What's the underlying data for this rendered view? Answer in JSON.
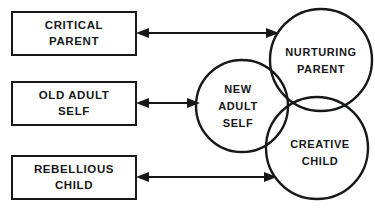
{
  "diagram": {
    "type": "relationship-venn-diagram",
    "background_color": "#ffffff",
    "stroke_color": "#16181a",
    "boxes": [
      {
        "id": "critical-parent",
        "line1": "CRITICAL",
        "line2": "PARENT",
        "full_label": "CRITICAL PARENT"
      },
      {
        "id": "old-adult-self",
        "line1": "OLD ADULT",
        "line2": "SELF",
        "full_label": "OLD ADULT SELF"
      },
      {
        "id": "rebellious-child",
        "line1": "REBELLIOUS",
        "line2": "CHILD",
        "full_label": "REBELLIOUS CHILD"
      }
    ],
    "circles": [
      {
        "id": "nurturing-parent",
        "line1": "NURTURING",
        "line2": "PARENT",
        "full_label": "NURTURING PARENT"
      },
      {
        "id": "new-adult-self",
        "line1": "NEW",
        "line2": "ADULT",
        "line3": "SELF",
        "full_label": "NEW ADULT SELF"
      },
      {
        "id": "creative-child",
        "line1": "CREATIVE",
        "line2": "CHILD",
        "full_label": "CREATIVE CHILD"
      }
    ],
    "connectors": [
      {
        "id": "critical-parent-to-nurturing-parent",
        "from": "CRITICAL PARENT",
        "to": "NURTURING PARENT",
        "style": "double-headed-arrow"
      },
      {
        "id": "old-adult-self-to-new-adult-self",
        "from": "OLD ADULT SELF",
        "to": "NEW ADULT SELF",
        "style": "double-headed-arrow"
      },
      {
        "id": "rebellious-child-to-creative-child",
        "from": "REBELLIOUS CHILD",
        "to": "CREATIVE CHILD",
        "style": "double-headed-arrow"
      }
    ]
  }
}
